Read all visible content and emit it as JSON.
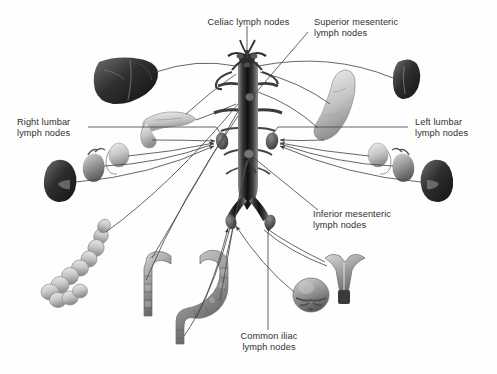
{
  "figure": {
    "type": "anatomical-diagram",
    "background_color": "#ffffff",
    "line_color": "#4a4a4a",
    "text_color": "#2f2f2f"
  },
  "labels": {
    "celiac": "Celiac lymph nodes",
    "superior_mesenteric": "Superior mesenteric\nlymph nodes",
    "right_lumbar": "Right lumbar\nlymph nodes",
    "left_lumbar": "Left lumbar\nlymph nodes",
    "inferior_mesenteric": "Inferior mesenteric\nlymph nodes",
    "common_iliac": "Common iliac\nlymph nodes"
  },
  "structures": {
    "aorta": "abdominal-aorta",
    "bifurcation": "aortic-bifurcation",
    "organs": [
      {
        "name": "liver",
        "side": "left",
        "tone": "dark"
      },
      {
        "name": "spleen",
        "side": "right",
        "tone": "dark"
      },
      {
        "name": "stomach",
        "side": "right",
        "tone": "light"
      },
      {
        "name": "pancreas",
        "side": "left",
        "tone": "light"
      },
      {
        "name": "kidney-right",
        "side": "left",
        "tone": "dark"
      },
      {
        "name": "kidney-left",
        "side": "right",
        "tone": "dark"
      },
      {
        "name": "adrenal-gland-right",
        "side": "left",
        "tone": "mid"
      },
      {
        "name": "adrenal-gland-left",
        "side": "right",
        "tone": "mid"
      },
      {
        "name": "gonad-right",
        "side": "left",
        "tone": "light"
      },
      {
        "name": "gonad-left",
        "side": "right",
        "tone": "light"
      },
      {
        "name": "small-intestine",
        "side": "left",
        "tone": "light"
      },
      {
        "name": "ascending-colon",
        "side": "center-left",
        "tone": "mid"
      },
      {
        "name": "descending-sigmoid-colon",
        "side": "center",
        "tone": "mid"
      },
      {
        "name": "uterus",
        "side": "right",
        "tone": "mid"
      },
      {
        "name": "bladder",
        "side": "right",
        "tone": "mid"
      }
    ],
    "lymph_nodes": [
      {
        "name": "right-lumbar-node",
        "x": 222,
        "y": 141
      },
      {
        "name": "left-lumbar-node",
        "x": 272,
        "y": 141
      },
      {
        "name": "celiac-node-cluster",
        "x": 247,
        "y": 70
      },
      {
        "name": "superior-mesenteric-node",
        "x": 250,
        "y": 98
      },
      {
        "name": "inferior-mesenteric-node",
        "x": 250,
        "y": 155
      },
      {
        "name": "common-iliac-node-right",
        "x": 231,
        "y": 222
      },
      {
        "name": "common-iliac-node-left",
        "x": 270,
        "y": 222
      }
    ]
  }
}
